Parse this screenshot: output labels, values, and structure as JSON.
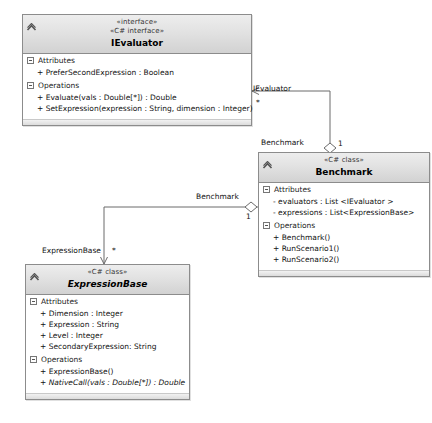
{
  "diagram": {
    "type": "uml-class-diagram",
    "background": "#ffffff",
    "header_gradient_top": "#ededed",
    "header_gradient_bottom": "#d2d2d2",
    "border_color": "#8c8c8c"
  },
  "classes": [
    {
      "id": "ievaluator",
      "stereotype_1": "«interface»",
      "stereotype_2": "«C# interface»",
      "name": "IEvaluator",
      "abstract": false,
      "sections": [
        {
          "title": "Attributes",
          "members": [
            {
              "text": "+ PreferSecondExpression : Boolean",
              "italic": false
            }
          ]
        },
        {
          "title": "Operations",
          "members": [
            {
              "text": "+ Evaluate(vals : Double[*]) : Double",
              "italic": false
            },
            {
              "text": "+ SetExpression(expression : String, dimension : Integer)",
              "italic": false
            }
          ]
        }
      ]
    },
    {
      "id": "benchmark",
      "stereotype_1": "",
      "stereotype_2": "«C# class»",
      "name": "Benchmark",
      "abstract": false,
      "sections": [
        {
          "title": "Attributes",
          "members": [
            {
              "text": "- evaluators : List <IEvaluator >",
              "italic": false
            },
            {
              "text": "- expressions : List<ExpressionBase>",
              "italic": false
            }
          ]
        },
        {
          "title": "Operations",
          "members": [
            {
              "text": "+ Benchmark()",
              "italic": false
            },
            {
              "text": "+ RunScenario1()",
              "italic": false
            },
            {
              "text": "+ RunScenario2()",
              "italic": false
            }
          ]
        }
      ]
    },
    {
      "id": "expressionbase",
      "stereotype_1": "",
      "stereotype_2": "«C# class»",
      "name": "ExpressionBase",
      "abstract": true,
      "sections": [
        {
          "title": "Attributes",
          "members": [
            {
              "text": "+ Dimension : Integer",
              "italic": false
            },
            {
              "text": "+ Expression : String",
              "italic": false
            },
            {
              "text": "+ Level : Integer",
              "italic": false
            },
            {
              "text": "+ SecondaryExpression: String",
              "italic": false
            }
          ]
        },
        {
          "title": "Operations",
          "members": [
            {
              "text": "+ ExpressionBase()",
              "italic": false
            },
            {
              "text": "+ NativeCall(vals : Double[*]) : Double",
              "italic": true
            }
          ]
        }
      ]
    }
  ],
  "associations": [
    {
      "id": "benchmark-ievaluator",
      "kind": "aggregation",
      "source": "benchmark",
      "target": "ievaluator",
      "source_role": "Benchmark",
      "source_multiplicity": "1",
      "target_role": "IEvaluator",
      "target_multiplicity": "*"
    },
    {
      "id": "benchmark-expressionbase",
      "kind": "aggregation",
      "source": "benchmark",
      "target": "expressionbase",
      "source_role": "Benchmark",
      "source_multiplicity": "1",
      "target_role": "ExpressionBase",
      "target_multiplicity": "*"
    }
  ],
  "icons": {
    "collapse_chevron": "chevron-up-icon",
    "section_toggle": "minus-box-icon"
  }
}
